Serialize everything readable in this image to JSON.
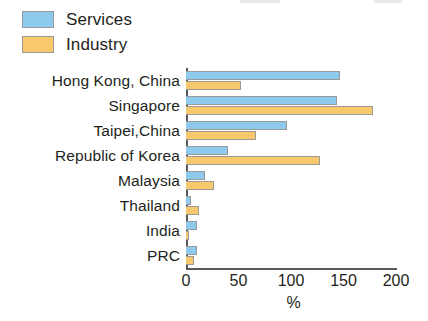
{
  "chart_data": {
    "type": "bar",
    "orientation": "horizontal",
    "title": "",
    "xlabel": "%",
    "ylabel": "",
    "xlim": [
      0,
      200
    ],
    "xticks": [
      0,
      50,
      100,
      150,
      200
    ],
    "xtick_labels": [
      "0",
      "50",
      "100",
      "150",
      "200"
    ],
    "grid": false,
    "legend_position": "top-left",
    "categories": [
      "Hong Kong, China",
      "Singapore",
      "Taipei,China",
      "Republic of Korea",
      "Malaysia",
      "Thailand",
      "India",
      "PRC"
    ],
    "series": [
      {
        "name": "Services",
        "color": "#8ecaec",
        "values": [
          147,
          144,
          96,
          40,
          18,
          5,
          10,
          10
        ]
      },
      {
        "name": "Industry",
        "color": "#f8c86c",
        "values": [
          52,
          178,
          67,
          128,
          27,
          12,
          3,
          8
        ]
      }
    ]
  },
  "legend": {
    "items": [
      {
        "label": "Services",
        "color": "#8ecaec"
      },
      {
        "label": "Industry",
        "color": "#f8c86c"
      }
    ]
  },
  "axis": {
    "x_unit_label": "%"
  }
}
